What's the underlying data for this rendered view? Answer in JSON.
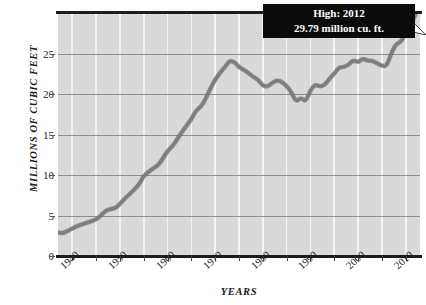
{
  "chart_data": {
    "type": "line",
    "title": "",
    "xlabel": "YEARS",
    "ylabel": "MILLIONS OF CUBIC FEET",
    "xlim": [
      1937,
      2013
    ],
    "ylim": [
      0,
      30
    ],
    "xticks": [
      1940,
      1950,
      1960,
      1970,
      1980,
      1990,
      2000,
      2010
    ],
    "xtick_labels": [
      "1940",
      "1950",
      "1960",
      "1970",
      "1980",
      "1990",
      "2000",
      "2010"
    ],
    "yticks": [
      0,
      5,
      10,
      15,
      20,
      25
    ],
    "ytick_labels": [
      "0",
      "5",
      "10",
      "15",
      "20",
      "25"
    ],
    "grid": "vertical white gridlines every 5 years, horizontal gray gridlines at each y tick",
    "legend": "none",
    "line_color": "#7d7d7d",
    "line_outline_color": "#5a5a5a",
    "plot_background": "#d9d9d9",
    "annotation": {
      "label_line1": "High: 2012",
      "label_line2": "29.79 million cu. ft.",
      "year": 2012,
      "value": 29.79,
      "box_color": "#0b0b0b",
      "text_color": "#ffffff"
    },
    "x": [
      1937,
      1938,
      1939,
      1940,
      1941,
      1942,
      1943,
      1944,
      1945,
      1946,
      1947,
      1948,
      1949,
      1950,
      1951,
      1952,
      1953,
      1954,
      1955,
      1956,
      1957,
      1958,
      1959,
      1960,
      1961,
      1962,
      1963,
      1964,
      1965,
      1966,
      1967,
      1968,
      1969,
      1970,
      1971,
      1972,
      1973,
      1974,
      1975,
      1976,
      1977,
      1978,
      1979,
      1980,
      1981,
      1982,
      1983,
      1984,
      1985,
      1986,
      1987,
      1988,
      1989,
      1990,
      1991,
      1992,
      1993,
      1994,
      1995,
      1996,
      1997,
      1998,
      1999,
      2000,
      2001,
      2002,
      2003,
      2004,
      2005,
      2006,
      2007,
      2008,
      2009,
      2010,
      2011,
      2012
    ],
    "values": [
      2.9,
      2.8,
      3.1,
      3.4,
      3.7,
      3.9,
      4.1,
      4.3,
      4.5,
      5.0,
      5.6,
      5.8,
      5.9,
      6.4,
      7.1,
      7.6,
      8.2,
      8.8,
      9.9,
      10.4,
      10.8,
      11.2,
      12.0,
      13.0,
      13.5,
      14.4,
      15.3,
      16.1,
      16.9,
      18.0,
      18.4,
      19.4,
      20.7,
      21.8,
      22.6,
      23.3,
      24.1,
      24.0,
      23.3,
      23.0,
      22.6,
      22.1,
      21.8,
      21.0,
      20.9,
      21.4,
      21.7,
      21.5,
      21.0,
      20.2,
      19.0,
      19.6,
      19.0,
      20.5,
      21.2,
      20.9,
      21.1,
      21.9,
      22.5,
      23.3,
      23.3,
      23.6,
      24.2,
      23.9,
      24.4,
      24.1,
      24.1,
      23.8,
      23.5,
      23.4,
      25.1,
      26.2,
      26.4,
      27.5,
      28.5,
      29.79
    ]
  },
  "axes": {
    "ylabel_text": "MILLIONS OF CUBIC FEET",
    "xlabel_text": "YEARS"
  }
}
